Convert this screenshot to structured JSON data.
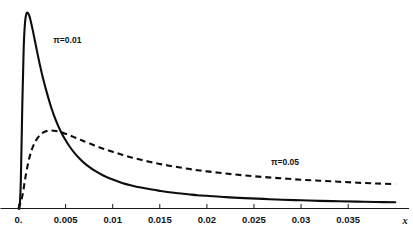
{
  "chart_data": {
    "type": "line",
    "title": "",
    "subtitle": "",
    "xlabel": "x",
    "ylabel": "",
    "xlim": [
      0,
      0.0405
    ],
    "ylim": [
      0,
      1
    ],
    "grid": false,
    "legend_position": "inline-annotations",
    "xticks": [
      0,
      0.005,
      0.01,
      0.015,
      0.02,
      0.025,
      0.03,
      0.035
    ],
    "xticklabels": [
      "0.",
      "0.005",
      "0.01",
      "0.015",
      "0.02",
      "0.025",
      "0.03",
      "0.035"
    ],
    "yticks": [],
    "yticklabels": [],
    "annotations": [
      {
        "text": "π=0.01",
        "x": 0.0037,
        "y": 0.845,
        "name": "pi-001-label"
      },
      {
        "text": "π=0.05",
        "x": 0.0268,
        "y": 0.225,
        "name": "pi-005-label"
      }
    ],
    "series": [
      {
        "name": "π=0.01",
        "style": "solid",
        "color": "#0d0d0d",
        "x": [
          0.0,
          0.00012,
          0.00025,
          0.0004,
          0.00055,
          0.0007,
          0.00085,
          0.001,
          0.00115,
          0.0013,
          0.0015,
          0.0017,
          0.002,
          0.0023,
          0.0026,
          0.003,
          0.0035,
          0.004,
          0.0045,
          0.005,
          0.0055,
          0.006,
          0.0065,
          0.007,
          0.0075,
          0.008,
          0.009,
          0.01,
          0.011,
          0.012,
          0.013,
          0.014,
          0.015,
          0.016,
          0.017,
          0.018,
          0.019,
          0.02,
          0.022,
          0.024,
          0.026,
          0.028,
          0.03,
          0.032,
          0.034,
          0.036,
          0.038,
          0.04
        ],
        "y": [
          0.0,
          0.012,
          0.145,
          0.52,
          0.82,
          0.955,
          0.998,
          1.0,
          0.985,
          0.958,
          0.915,
          0.868,
          0.796,
          0.728,
          0.666,
          0.594,
          0.513,
          0.447,
          0.393,
          0.349,
          0.312,
          0.281,
          0.255,
          0.232,
          0.213,
          0.196,
          0.169,
          0.148,
          0.131,
          0.118,
          0.107,
          0.098,
          0.09,
          0.083,
          0.078,
          0.073,
          0.068,
          0.065,
          0.058,
          0.053,
          0.049,
          0.045,
          0.042,
          0.039,
          0.037,
          0.035,
          0.033,
          0.032
        ]
      },
      {
        "name": "π=0.05",
        "style": "dashed",
        "color": "#0d0d0d",
        "x": [
          0.0,
          0.0004,
          0.0008,
          0.0012,
          0.0016,
          0.002,
          0.0025,
          0.003,
          0.0035,
          0.004,
          0.0045,
          0.005,
          0.0055,
          0.006,
          0.0065,
          0.007,
          0.008,
          0.009,
          0.01,
          0.011,
          0.012,
          0.013,
          0.014,
          0.015,
          0.016,
          0.017,
          0.018,
          0.019,
          0.02,
          0.022,
          0.024,
          0.026,
          0.028,
          0.03,
          0.032,
          0.034,
          0.036,
          0.038,
          0.04
        ],
        "y": [
          0.0,
          0.062,
          0.178,
          0.268,
          0.324,
          0.359,
          0.385,
          0.396,
          0.399,
          0.396,
          0.39,
          0.382,
          0.373,
          0.363,
          0.353,
          0.343,
          0.324,
          0.306,
          0.29,
          0.275,
          0.261,
          0.249,
          0.238,
          0.228,
          0.219,
          0.211,
          0.203,
          0.196,
          0.19,
          0.179,
          0.169,
          0.161,
          0.154,
          0.147,
          0.142,
          0.137,
          0.132,
          0.128,
          0.125
        ]
      }
    ]
  }
}
